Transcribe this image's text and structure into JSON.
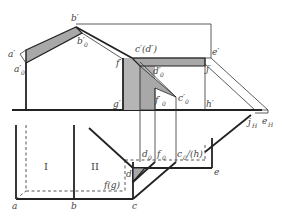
{
  "figure": {
    "type": "shadow construction in orthographic projection (elevation and plan)",
    "elevation_labels": {
      "a_prime": "a′",
      "a0_prime": "a′",
      "b_prime": "b′",
      "b0_prime": "b′",
      "c_prime_d_prime": "c′(d′)",
      "d0_prime": "d′",
      "e_prime": "e′",
      "f_prime": "f′",
      "f0_prime": "f′",
      "c0_prime": "c′",
      "g_prime": "g′",
      "h_prime": "h′",
      "j_prime": "j′",
      "subscript_0": "0",
      "jH": "j",
      "eH": "e",
      "subscript_H": "H"
    },
    "plan_labels": {
      "a": "a",
      "b": "b",
      "c": "c",
      "d": "d",
      "e": "e",
      "f_g": "f(g)",
      "d0": "d",
      "f0": "f",
      "c0_h": "c",
      "h_paren": "/(h)",
      "subscript_0": "0"
    },
    "regions": {
      "region_1": "I",
      "region_2": "II"
    },
    "colors": {
      "line": "#222222",
      "shadow_fill": "#a8a8a8",
      "background": "#ffffff"
    }
  }
}
